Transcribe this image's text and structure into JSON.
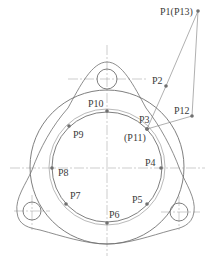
{
  "diagram": {
    "type": "toolpath-on-flange",
    "colors": {
      "stroke": "#707070",
      "label": "#3a3a3a",
      "background": "#ffffff"
    },
    "points": [
      {
        "id": "P1",
        "label": "P1(P13)",
        "x": 198,
        "y": 11,
        "lx": 160,
        "ly": 15
      },
      {
        "id": "P2",
        "label": "P2",
        "x": 166,
        "y": 86,
        "lx": 152,
        "ly": 84
      },
      {
        "id": "P3",
        "label": "P3",
        "x": 147,
        "y": 129,
        "lx": 139,
        "ly": 123
      },
      {
        "id": "P11",
        "label": "(P11)",
        "x": 147,
        "y": 129,
        "lx": 124,
        "ly": 141
      },
      {
        "id": "P4",
        "label": "P4",
        "x": 161,
        "y": 168,
        "lx": 145,
        "ly": 166
      },
      {
        "id": "P5",
        "label": "P5",
        "x": 147,
        "y": 204,
        "lx": 132,
        "ly": 203
      },
      {
        "id": "P6",
        "label": "P6",
        "x": 107,
        "y": 223,
        "lx": 109,
        "ly": 218
      },
      {
        "id": "P7",
        "label": "P7",
        "x": 66,
        "y": 204,
        "lx": 70,
        "ly": 199
      },
      {
        "id": "P8",
        "label": "P8",
        "x": 52,
        "y": 168,
        "lx": 58,
        "ly": 176
      },
      {
        "id": "P9",
        "label": "P9",
        "x": 69,
        "y": 126,
        "lx": 73,
        "ly": 138
      },
      {
        "id": "P10",
        "label": "P10",
        "x": 107,
        "y": 111,
        "lx": 88,
        "ly": 107
      },
      {
        "id": "P12",
        "label": "P12",
        "x": 192,
        "y": 116,
        "lx": 174,
        "ly": 114
      }
    ]
  }
}
